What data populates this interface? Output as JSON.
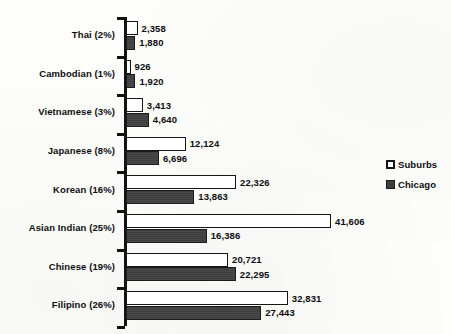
{
  "chart_data": {
    "type": "bar",
    "orientation": "horizontal",
    "title": "",
    "subtitle": "",
    "xlabel": "",
    "ylabel": "",
    "grid": false,
    "xlim": [
      0,
      41606
    ],
    "legend_position": "right",
    "categories": [
      "Thai (2%)",
      "Cambodian (1%)",
      "Vietnamese (3%)",
      "Japanese (8%)",
      "Korean (16%)",
      "Asian Indian (25%)",
      "Chinese (19%)",
      "Filipino (26%)"
    ],
    "series": [
      {
        "name": "Suburbs",
        "color": "#ffffff",
        "values": [
          2358,
          926,
          3413,
          12124,
          22326,
          41606,
          20721,
          32831
        ],
        "labels": [
          "2,358",
          "926",
          "3,413",
          "12,124",
          "22,326",
          "41,606",
          "20,721",
          "32,831"
        ]
      },
      {
        "name": "Chicago",
        "color": "#3e3e3e",
        "values": [
          1880,
          1920,
          4640,
          6696,
          13863,
          16386,
          22295,
          27443
        ],
        "labels": [
          "1,880",
          "1,920",
          "4,640",
          "6,696",
          "13,863",
          "16,386",
          "22,295",
          "27,443"
        ]
      }
    ]
  },
  "legend": {
    "items": [
      {
        "label": "Suburbs",
        "swatch": "hollow-square-marker"
      },
      {
        "label": "Chicago",
        "swatch": "filled-square-marker"
      }
    ]
  },
  "colors": {
    "suburbs_fill": "#ffffff",
    "chicago_fill": "#3e3e3e",
    "outline": "#161616",
    "text": "#0d0d0d",
    "background": "#fdfdfc"
  }
}
